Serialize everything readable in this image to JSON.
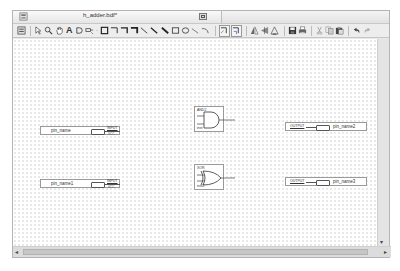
{
  "window": {
    "title": "h_adder.bdf*"
  },
  "toolbar": {
    "tools": [
      {
        "name": "fit-window-icon",
        "glyph": "▦"
      },
      {
        "name": "selection-tool-icon",
        "glyph": "↖"
      },
      {
        "name": "zoom-tool-icon",
        "glyph": "🔍"
      },
      {
        "name": "hand-tool-icon",
        "glyph": "✋"
      },
      {
        "name": "text-tool-icon",
        "glyph": "A"
      },
      {
        "name": "symbol-tool-icon",
        "glyph": "D"
      },
      {
        "name": "pin-tool-icon",
        "glyph": "⊸"
      },
      {
        "name": "orthogonal-node-icon",
        "glyph": "□"
      },
      {
        "name": "orthogonal-bus-icon",
        "glyph": "⌐"
      },
      {
        "name": "orthogonal-conduit-icon",
        "glyph": "⌐"
      },
      {
        "name": "node-tool-icon",
        "glyph": "⌐"
      },
      {
        "name": "diagonal-line-icon",
        "glyph": "╲"
      },
      {
        "name": "diagonal-bus-icon",
        "glyph": "╲"
      },
      {
        "name": "diagonal-conduit-icon",
        "glyph": "╲"
      },
      {
        "name": "rectangle-tool-icon",
        "glyph": "□"
      },
      {
        "name": "oval-tool-icon",
        "glyph": "○"
      },
      {
        "name": "line-tool-icon",
        "glyph": "╲"
      },
      {
        "name": "arc-tool-icon",
        "glyph": "⌒"
      },
      {
        "name": "partial-line-select-icon",
        "glyph": "⌐"
      },
      {
        "name": "rubberbanding-icon",
        "glyph": "⌐"
      },
      {
        "name": "flip-horizontal-icon",
        "glyph": "◮"
      },
      {
        "name": "flip-vertical-icon",
        "glyph": "◭"
      },
      {
        "name": "rotate-icon",
        "glyph": "◬"
      },
      {
        "name": "save-icon",
        "glyph": "■"
      },
      {
        "name": "print-icon",
        "glyph": "⎙"
      },
      {
        "name": "cut-icon",
        "glyph": "✂"
      },
      {
        "name": "copy-icon",
        "glyph": "⧉"
      },
      {
        "name": "paste-icon",
        "glyph": "▣"
      },
      {
        "name": "undo-icon",
        "glyph": "↶"
      },
      {
        "name": "redo-icon",
        "glyph": "↷"
      }
    ]
  },
  "schematic": {
    "input_pins": [
      {
        "name": "pin_name",
        "type": "INPUT",
        "vcc": "VCC"
      },
      {
        "name": "pin_name1",
        "type": "INPUT",
        "vcc": "VCC"
      }
    ],
    "output_pins": [
      {
        "name": "pin_name2",
        "type": "OUTPUT"
      },
      {
        "name": "pin_name3",
        "type": "OUTPUT"
      }
    ],
    "gates": [
      {
        "type": "AND2",
        "instance": "inst"
      },
      {
        "type": "XOR",
        "instance": "inst2"
      }
    ]
  },
  "scrollbars": {
    "left_arrow": "◂",
    "right_arrow": "▸",
    "down_arrow": "▾"
  }
}
